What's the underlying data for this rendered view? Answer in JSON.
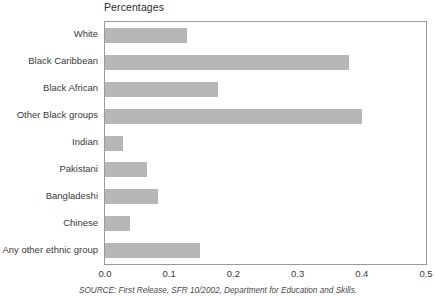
{
  "chart_data": {
    "type": "bar",
    "orientation": "horizontal",
    "title": "Percentages",
    "xlabel": "",
    "ylabel": "",
    "xlim": [
      0.0,
      0.5
    ],
    "grid": false,
    "legend": null,
    "xticks": [
      "0.0",
      "0.1",
      "0.2",
      "0.3",
      "0.4",
      "0.5"
    ],
    "xtick_values": [
      0.0,
      0.1,
      0.2,
      0.3,
      0.4,
      0.5
    ],
    "categories": [
      "White",
      "Black Caribbean",
      "Black African",
      "Other Black groups",
      "Indian",
      "Pakistani",
      "Bangladeshi",
      "Chinese",
      "Any other ethnic group"
    ],
    "values": [
      0.127,
      0.38,
      0.176,
      0.4,
      0.028,
      0.066,
      0.082,
      0.039,
      0.148
    ],
    "bar_color": "#b7b7b7",
    "axis_color": "#9a9a9a"
  },
  "source": {
    "note": "SOURCE: First Release, SFR 10/2002, Department for Education and Skills."
  }
}
